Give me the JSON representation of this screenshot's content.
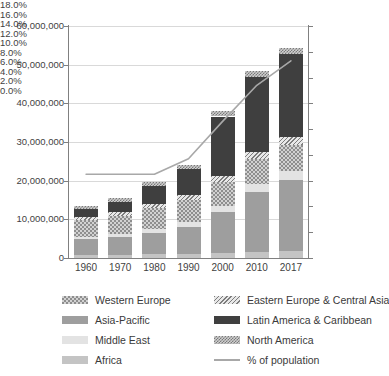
{
  "chart_data": {
    "type": "bar",
    "title": "",
    "xlabel": "",
    "ylabel": "",
    "y2label": "",
    "grid": true,
    "legend_position": "bottom",
    "stacked": true,
    "categories": [
      "1960",
      "1970",
      "1980",
      "1990",
      "2000",
      "2010",
      "2017"
    ],
    "ylim": [
      0,
      60000000
    ],
    "ytick_labels": [
      "60,000,000",
      "50,000,000",
      "40,000,000",
      "30,000,000",
      "20,000,000",
      "10,000,000",
      "0"
    ],
    "ytick_values": [
      60000000,
      50000000,
      40000000,
      30000000,
      20000000,
      10000000,
      0
    ],
    "y2lim": [
      0,
      0.18
    ],
    "y2tick_labels": [
      "18.0%",
      "16.0%",
      "14.0%",
      "12.0%",
      "10.0%",
      "8.0%",
      "6.0%",
      "4.0%",
      "2.0%",
      "0.0%"
    ],
    "y2tick_values": [
      18.0,
      16.0,
      14.0,
      12.0,
      10.0,
      8.0,
      6.0,
      4.0,
      2.0,
      0.0
    ],
    "series": [
      {
        "name": "Africa",
        "values": [
          700000,
          800000,
          1000000,
          1100000,
          1300000,
          1600000,
          1800000
        ]
      },
      {
        "name": "Asia-Pacific",
        "values": [
          4200000,
          4600000,
          5500000,
          7000000,
          10500000,
          15500000,
          18500000
        ]
      },
      {
        "name": "Middle East",
        "values": [
          600000,
          700000,
          900000,
          1200000,
          1600000,
          2000000,
          2300000
        ]
      },
      {
        "name": "Western Europe",
        "values": [
          4300000,
          4800000,
          5500000,
          5800000,
          6200000,
          6500000,
          6700000
        ]
      },
      {
        "name": "Eastern Europe & Central Asia",
        "values": [
          900000,
          1000000,
          1100000,
          1300000,
          1500000,
          1700000,
          1900000
        ]
      },
      {
        "name": "Latin America & Caribbean",
        "values": [
          1900000,
          2700000,
          4600000,
          6500000,
          15500000,
          19500000,
          21500000
        ]
      },
      {
        "name": "North America",
        "values": [
          900000,
          1000000,
          1100000,
          1200000,
          1300000,
          1500000,
          1700000
        ]
      }
    ],
    "line_series": {
      "name": "% of population",
      "values": [
        6.5,
        6.5,
        6.5,
        7.7,
        10.6,
        13.4,
        15.3
      ]
    },
    "colors": {
      "western_europe": "#d2d2d2",
      "eastern_europe": "#e8e8e8",
      "asia_pacific": "#9e9e9e",
      "latin_america": "#3f3f3f",
      "middle_east": "#e3e3e3",
      "north_america": "#cfcfcf",
      "africa": "#c4c4c4",
      "line": "#a8a8a8",
      "grid": "#d9d9d9",
      "axis": "#808080"
    }
  },
  "legend": {
    "column1": [
      {
        "label": "Western Europe",
        "swatch": "western-europe-swatch"
      },
      {
        "label": "Asia-Pacific",
        "swatch": "asia-pacific-swatch"
      },
      {
        "label": "Middle East",
        "swatch": "middle-east-swatch"
      },
      {
        "label": "Africa",
        "swatch": "africa-swatch"
      }
    ],
    "column2": [
      {
        "label": "Eastern Europe & Central Asia",
        "swatch": "eastern-europe-swatch"
      },
      {
        "label": "Latin America & Caribbean",
        "swatch": "latin-america-swatch"
      },
      {
        "label": "North America",
        "swatch": "north-america-swatch"
      },
      {
        "label": "% of population",
        "swatch": "percent-line-swatch"
      }
    ]
  }
}
